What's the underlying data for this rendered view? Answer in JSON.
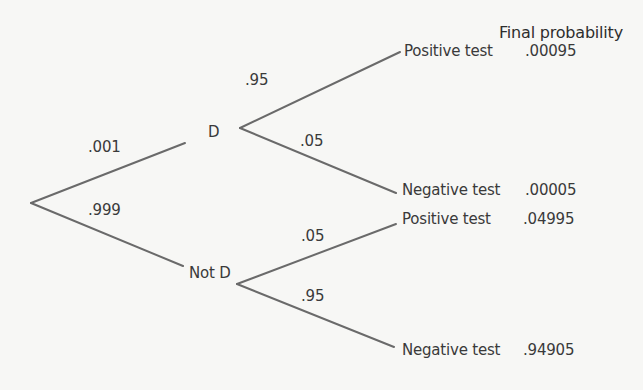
{
  "header": {
    "title": "Final probability"
  },
  "root": {
    "branches": [
      {
        "label": "D",
        "probability": ".001",
        "outcomes": [
          {
            "label": "Positive test",
            "probability": ".95",
            "final_probability": ".00095"
          },
          {
            "label": "Negative test",
            "probability": ".05",
            "final_probability": ".00005"
          }
        ]
      },
      {
        "label": "Not D",
        "probability": ".999",
        "outcomes": [
          {
            "label": "Positive test",
            "probability": ".05",
            "final_probability": ".04995"
          },
          {
            "label": "Negative test",
            "probability": ".95",
            "final_probability": ".94905"
          }
        ]
      }
    ]
  },
  "colors": {
    "line": "#6a6a6a",
    "text": "#3a3a3a",
    "background": "#f7f7f5"
  }
}
